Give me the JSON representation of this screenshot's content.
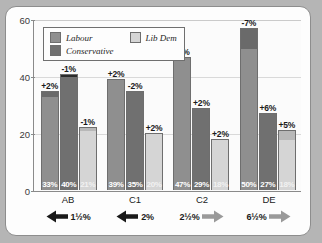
{
  "chart_data": {
    "type": "bar",
    "title": "",
    "subtitle": "",
    "xlabel": "",
    "ylabel": "",
    "ylim": [
      0,
      60
    ],
    "yticks": [
      0,
      20,
      40,
      60
    ],
    "grid": true,
    "legend_position": "top-left",
    "stacked_change_cap": true,
    "categories": [
      "AB",
      "C1",
      "C2",
      "DE"
    ],
    "series": [
      {
        "name": "Labour",
        "color": "#8f8f8f",
        "cap_color": "#6a6a6a",
        "values": [
          33,
          39,
          47,
          50
        ],
        "changes": [
          "+2%",
          "+2%",
          "-3%",
          "-7%"
        ],
        "value_labels": [
          "33%",
          "40%",
          "47%",
          "50%"
        ]
      },
      {
        "name": "Conservative",
        "color": "#707070",
        "cap_color": "#2b2b2b",
        "values": [
          40,
          35,
          29,
          27
        ],
        "changes": [
          "-1%",
          "-2%",
          "+2%",
          "+6%"
        ],
        "value_labels": [
          "40%",
          "35%",
          "29%",
          "27%"
        ]
      },
      {
        "name": "Lib Dem",
        "color": "#d5d5d5",
        "cap_color": "#b8b8b8",
        "values": [
          21,
          20,
          18,
          18
        ],
        "changes": [
          "-1%",
          "+2%",
          "+2%",
          "+5%"
        ],
        "value_labels": [
          "21%",
          "20%",
          "18%",
          "18%"
        ]
      }
    ],
    "bars": [
      {
        "group": "AB",
        "party": "Labour",
        "value": 33,
        "top": 35,
        "change": "+2%",
        "label": "33%"
      },
      {
        "group": "AB",
        "party": "Conservative",
        "value": 40,
        "top": 41,
        "change": "-1%",
        "label": "40%"
      },
      {
        "group": "AB",
        "party": "Lib Dem",
        "value": 21,
        "top": 22,
        "change": "-1%",
        "label": "21%"
      },
      {
        "group": "C1",
        "party": "Labour",
        "value": 39,
        "top": 39,
        "change": "+2%",
        "label": "39%"
      },
      {
        "group": "C1",
        "party": "Conservative",
        "value": 35,
        "top": 35,
        "change": "-2%",
        "label": "35%"
      },
      {
        "group": "C1",
        "party": "Lib Dem",
        "value": 20,
        "top": 20,
        "change": "+2%",
        "label": "20%"
      },
      {
        "group": "C2",
        "party": "Labour",
        "value": 47,
        "top": 47,
        "change": "-3%",
        "label": "47%"
      },
      {
        "group": "C2",
        "party": "Conservative",
        "value": 29,
        "top": 29,
        "change": "+2%",
        "label": "29%"
      },
      {
        "group": "C2",
        "party": "Lib Dem",
        "value": 18,
        "top": 18,
        "change": "+2%",
        "label": "18%"
      },
      {
        "group": "DE",
        "party": "Labour",
        "value": 50,
        "top": 57,
        "change": "-7%",
        "label": "50%"
      },
      {
        "group": "DE",
        "party": "Conservative",
        "value": 27,
        "top": 27,
        "change": "+6%",
        "label": "27%"
      },
      {
        "group": "DE",
        "party": "Lib Dem",
        "value": 18,
        "top": 21,
        "change": "+5%",
        "label": "18%"
      }
    ],
    "swings": [
      {
        "group": "AB",
        "label": "1½%",
        "direction": "left",
        "arrow_color": "#1a1a1a"
      },
      {
        "group": "C1",
        "label": "2%",
        "direction": "left",
        "arrow_color": "#1a1a1a"
      },
      {
        "group": "C2",
        "label": "2½%",
        "direction": "right",
        "arrow_color": "#9a9a9a"
      },
      {
        "group": "DE",
        "label": "6½%",
        "direction": "right",
        "arrow_color": "#9a9a9a"
      }
    ]
  },
  "legend": {
    "items": [
      {
        "label": "Labour",
        "color": "#8f8f8f"
      },
      {
        "label": "Lib Dem",
        "color": "#d5d5d5"
      },
      {
        "label": "Conservative",
        "color": "#707070"
      }
    ]
  },
  "axis": {
    "yticks": [
      "0",
      "20",
      "40",
      "60"
    ],
    "categories": [
      "AB",
      "C1",
      "C2",
      "DE"
    ]
  },
  "colors": {
    "labour": "#8f8f8f",
    "conservative": "#707070",
    "libdem": "#d5d5d5",
    "labour_cap": "#6a6a6a",
    "conservative_cap": "#2b2b2b",
    "libdem_cap": "#b8b8b8",
    "frame": "#fdfdfd",
    "page_background": "#b5b5b5",
    "arrow_dark": "#1a1a1a",
    "arrow_light": "#9a9a9a"
  }
}
